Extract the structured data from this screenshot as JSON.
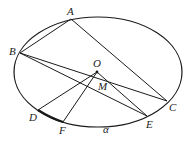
{
  "diagram": {
    "plane_label": "α",
    "points": {
      "A": {
        "label": "A",
        "x": 71,
        "y": 19,
        "lx": 67,
        "ly": 15
      },
      "B": {
        "label": "B",
        "x": 20,
        "y": 53,
        "lx": 9,
        "ly": 55
      },
      "C": {
        "label": "C",
        "x": 167,
        "y": 101,
        "lx": 169,
        "ly": 111
      },
      "O": {
        "label": "O",
        "x": 97,
        "y": 72,
        "lx": 93,
        "ly": 67
      },
      "M": {
        "label": "M",
        "x": 99,
        "y": 80,
        "lx": 98,
        "ly": 90
      },
      "D": {
        "label": "D",
        "x": 38,
        "y": 110,
        "lx": 29,
        "ly": 121
      },
      "F": {
        "label": "F",
        "x": 63,
        "y": 122,
        "lx": 59,
        "ly": 134
      },
      "E": {
        "label": "E",
        "x": 147,
        "y": 116,
        "lx": 146,
        "ly": 128
      }
    },
    "ellipse": {
      "cx": 98,
      "cy": 72,
      "rx": 84,
      "ry": 55
    },
    "segments": [
      [
        "A",
        "B"
      ],
      [
        "A",
        "C"
      ],
      [
        "B",
        "C"
      ],
      [
        "B",
        "E"
      ],
      [
        "O",
        "D"
      ],
      [
        "O",
        "F"
      ],
      [
        "O",
        "E"
      ]
    ],
    "thick_segment": [
      "D",
      "F"
    ],
    "alpha_pos": {
      "x": 103,
      "y": 133
    },
    "colors": {
      "stroke": "#1a1a1a",
      "background": "#ffffff"
    }
  }
}
